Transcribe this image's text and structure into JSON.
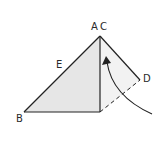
{
  "diagram": {
    "labels": {
      "A": "A",
      "C": "C",
      "E": "E",
      "B": "B",
      "D": "D"
    },
    "colors": {
      "fill": "#e6e6e6",
      "stroke": "#222222",
      "background": "#ffffff"
    }
  }
}
